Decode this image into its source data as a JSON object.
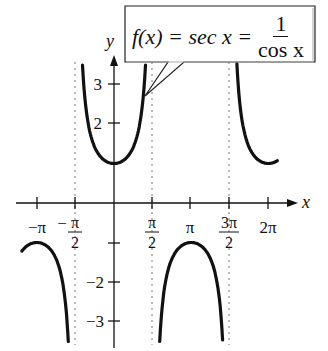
{
  "chart_data": {
    "type": "line",
    "function": "sec x",
    "xlabel": "x",
    "ylabel": "y",
    "xlim": [
      -4.2,
      5.9
    ],
    "ylim": [
      -3.5,
      3.6
    ],
    "x_ticks": [
      {
        "value": -3.14159,
        "label": "-π"
      },
      {
        "value": -1.5708,
        "label": "-π/2"
      },
      {
        "value": 1.5708,
        "label": "π/2"
      },
      {
        "value": 3.14159,
        "label": "π"
      },
      {
        "value": 4.71239,
        "label": "3π/2"
      },
      {
        "value": 6.28319,
        "label": "2π"
      }
    ],
    "y_ticks": [
      {
        "value": 3,
        "label": "3"
      },
      {
        "value": 2,
        "label": "2"
      },
      {
        "value": 1,
        "label": ""
      },
      {
        "value": -1,
        "label": ""
      },
      {
        "value": -2,
        "label": "-2"
      },
      {
        "value": -3,
        "label": "-3"
      }
    ],
    "asymptotes": [
      -1.5708,
      1.5708,
      4.71239
    ],
    "series": [
      {
        "name": "branch-left-lower",
        "x_range": [
          -3.75,
          -1.86
        ],
        "note": "downward arch, max -1 at x=-π"
      },
      {
        "name": "branch-center-upper",
        "x_range": [
          -1.28,
          1.28
        ],
        "note": "upward U, min 1 at x=0"
      },
      {
        "name": "branch-middle-lower",
        "x_range": [
          1.86,
          4.42
        ],
        "note": "downward arch, max -1 at x=π"
      },
      {
        "name": "branch-right-upper",
        "x_range": [
          5.0,
          6.65
        ],
        "note": "upward U, min 1 at x=2π"
      }
    ],
    "sample_points": [
      {
        "x": 0,
        "y": 1
      },
      {
        "x": 3.14159,
        "y": -1
      },
      {
        "x": -3.14159,
        "y": -1
      },
      {
        "x": 6.28319,
        "y": 1
      },
      {
        "x": 1.0472,
        "y": 2
      },
      {
        "x": -1.0472,
        "y": 2
      }
    ],
    "annotation": {
      "lhs": "f(x) = sec x =",
      "numerator": "1",
      "denominator": "cos x"
    },
    "grid": false,
    "legend": "none"
  },
  "labels": {
    "x_axis": "x",
    "y_axis": "y",
    "xticks": [
      "−π",
      "π",
      "2",
      "π",
      "π",
      "2",
      "π",
      "3π",
      "2",
      "2π"
    ],
    "neg_pi": "−π",
    "neg_pi_over_2_num": "π",
    "neg_pi_over_2_den": "2",
    "pi_over_2_num": "π",
    "pi_over_2_den": "2",
    "pi": "π",
    "three_pi_over_2_num": "3π",
    "three_pi_over_2_den": "2",
    "two_pi": "2π",
    "y3": "3",
    "y2": "2",
    "ym2": "−2",
    "ym3": "−3"
  }
}
